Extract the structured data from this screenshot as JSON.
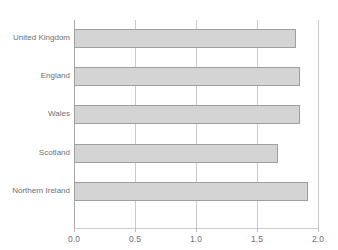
{
  "chart_data": {
    "type": "bar",
    "orientation": "horizontal",
    "title": "",
    "subtitle": "",
    "xlabel": "",
    "ylabel": "",
    "categories": [
      "United Kingdom",
      "England",
      "Wales",
      "Scotland",
      "Northern Ireland"
    ],
    "values": [
      1.82,
      1.85,
      1.85,
      1.67,
      1.92
    ],
    "series": [
      {
        "name": "",
        "values": [
          1.82,
          1.85,
          1.85,
          1.67,
          1.92
        ]
      }
    ],
    "xlim": [
      0.0,
      2.0
    ],
    "xticks": [
      0.0,
      0.5,
      1.0,
      1.5,
      2.0
    ],
    "xtick_labels": [
      "0.0",
      "0.5",
      "1.0",
      "1.5",
      "2.0"
    ],
    "grid": "vertical",
    "legend": "none",
    "bar_fill_color": "#d4d4d4",
    "bar_border_color": "#9e9e9e",
    "gridline_color": "#c9c9c9",
    "axis_color": "#a8a8a8",
    "text_color": "#6f6f6f"
  }
}
